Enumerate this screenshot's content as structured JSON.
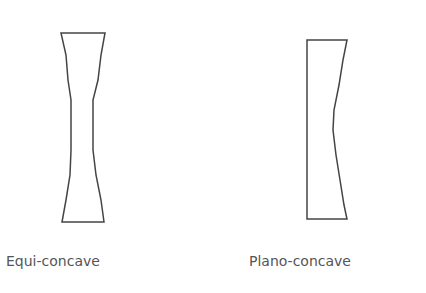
{
  "diagram": {
    "lenses": [
      {
        "id": "equi-concave",
        "label": "Equi-concave",
        "outline_color": "#444444",
        "points": "61,33 105,33 101,55 98,80 93,100 93,150 96,175 101,200 104,222 62,222 66,200 70,175 71,150 71,100 68,80 66,55"
      },
      {
        "id": "plano-concave",
        "label": "Plano-concave",
        "outline_color": "#444444",
        "points": "307,40 347,40 343,60 339,85 334,110 333,130 336,155 340,180 344,205 347,219 307,219"
      }
    ]
  }
}
